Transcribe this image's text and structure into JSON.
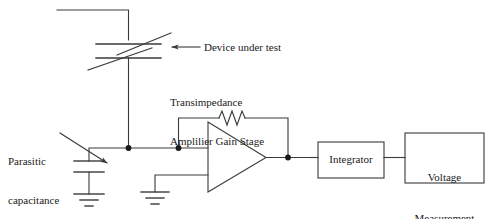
{
  "diagram": {
    "background_color": "#ffffff",
    "line_color": "#3a3a3a",
    "text_color": "#1a1a1a"
  },
  "labels": {
    "device_under_test": "Device under test",
    "transimpedance_line1": "Transimpedance",
    "transimpedance_line2": "Amplilier Gain Stage",
    "parasitic_line1": "Parasitic",
    "parasitic_line2": "capacitance"
  },
  "blocks": [
    {
      "id": "integrator",
      "label": "Integrator"
    },
    {
      "id": "voltage-measurement",
      "label_line1": "Voltage",
      "label_line2": "Measurement"
    }
  ],
  "components": {
    "dut": {
      "name": "variable-capacitor",
      "role": "device-under-test"
    },
    "parasitic_capacitor": {
      "name": "capacitor",
      "role": "parasitic-capacitance"
    },
    "feedback_resistor": {
      "name": "resistor",
      "role": "transimpedance-feedback"
    },
    "opamp": {
      "name": "operational-amplifier",
      "role": "transimpedance-gain-stage"
    },
    "grounds": [
      {
        "name": "ground-parasitic"
      },
      {
        "name": "ground-opamp-noninverting"
      }
    ]
  }
}
